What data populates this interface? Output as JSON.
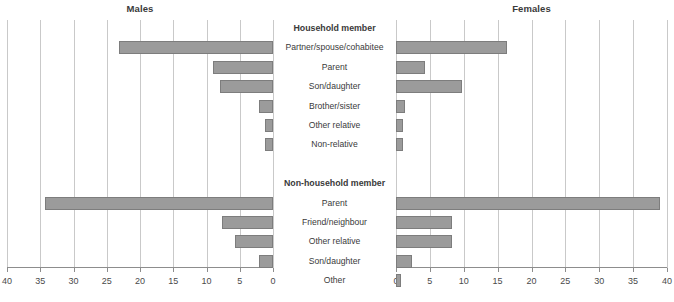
{
  "figure": {
    "left_title": "Males",
    "right_title": "Females"
  },
  "groups": [
    {
      "heading": "Household member",
      "categories": [
        "Partner/spouse/cohabitee",
        "Parent",
        "Son/daughter",
        "Brother/sister",
        "Other relative",
        "Non-relative"
      ]
    },
    {
      "heading": "Non-household member",
      "categories": [
        "Parent",
        "Friend/neighbour",
        "Other relative",
        "Son/daughter",
        "Other"
      ]
    }
  ],
  "axis": {
    "left_ticks": [
      "40",
      "35",
      "30",
      "25",
      "20",
      "15",
      "10",
      "5",
      "0"
    ],
    "right_ticks": [
      "0",
      "5",
      "10",
      "15",
      "20",
      "25",
      "30",
      "35",
      "40"
    ],
    "min": 0,
    "max": 40,
    "left_direction": "reversed",
    "right_direction": "normal"
  },
  "colors": {
    "bar_fill": "#9b9b9b",
    "bar_stroke": "#7d7d7d",
    "grid": "#c9c9c9",
    "axis": "#8d8d8d",
    "text": "#3a3a3a"
  },
  "chart_data": {
    "type": "bar",
    "orientation": "horizontal",
    "layout": "population-pyramid / back-to-back paired bar chart",
    "title": "",
    "xlabel": "",
    "ylabel": "",
    "xlim": [
      0,
      40
    ],
    "grid": true,
    "legend": "none",
    "panels": [
      "Males",
      "Females"
    ],
    "categories": [
      "Household member: Partner/spouse/cohabitee",
      "Household member: Parent",
      "Household member: Son/daughter",
      "Household member: Brother/sister",
      "Household member: Other relative",
      "Household member: Non-relative",
      "Non-household member: Parent",
      "Non-household member: Friend/neighbour",
      "Non-household member: Other relative",
      "Non-household member: Son/daughter",
      "Non-household member: Other"
    ],
    "series": [
      {
        "name": "Males",
        "values": [
          23.2,
          9.0,
          8.0,
          2.1,
          1.2,
          1.2,
          34.3,
          7.7,
          5.7,
          2.1,
          0.0
        ]
      },
      {
        "name": "Females",
        "values": [
          16.4,
          4.3,
          9.7,
          1.3,
          1.0,
          1.0,
          39.0,
          8.3,
          8.3,
          2.3,
          0.7
        ]
      }
    ]
  }
}
